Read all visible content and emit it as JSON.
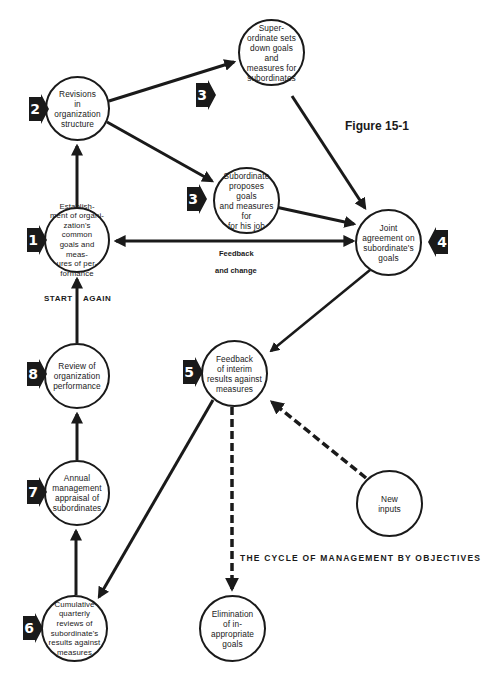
{
  "figure": {
    "title": "Figure 15-1",
    "caption": "THE CYCLE OF MANAGEMENT BY OBJECTIVES"
  },
  "labels": {
    "feedback": "Feedback",
    "and_change": "and  change",
    "start": "START",
    "again": "AGAIN"
  },
  "nodes": {
    "n1": {
      "step": "1",
      "lines": [
        "Establish-",
        "ment of organi-",
        "zation's common",
        "goals and meas-",
        "ures of per-",
        "formance"
      ]
    },
    "n2": {
      "step": "2",
      "lines": [
        "Revisions",
        "in organization",
        "structure"
      ]
    },
    "n3a": {
      "step": "3",
      "lines": [
        "Super-",
        "ordinate sets",
        "down goals and",
        "measures for",
        "subordinates"
      ]
    },
    "n3b": {
      "step": "3",
      "lines": [
        "Subordinate",
        "proposes goals",
        "and measures for",
        "for his job"
      ]
    },
    "n4": {
      "step": "4",
      "lines": [
        "Joint",
        "agreement on",
        "subordinate's",
        "goals"
      ]
    },
    "n5": {
      "step": "5",
      "lines": [
        "Feedback",
        "of interim",
        "results against",
        "measures"
      ]
    },
    "n6": {
      "step": "6",
      "lines": [
        "Cumulative",
        "quarterly",
        "reviews of",
        "subordinate's",
        "results against",
        "measures"
      ]
    },
    "n7": {
      "step": "7",
      "lines": [
        "Annual",
        "management",
        "appraisal of",
        "subordinates"
      ]
    },
    "n8": {
      "step": "8",
      "lines": [
        "Review of",
        "organization",
        "performance"
      ]
    },
    "new_inputs": {
      "lines": [
        "New",
        "inputs"
      ]
    },
    "elimination": {
      "lines": [
        "Elimination",
        "of in-",
        "appropriate",
        "goals"
      ]
    }
  },
  "colors": {
    "ink": "#1a1a1a",
    "background": "#ffffff"
  }
}
